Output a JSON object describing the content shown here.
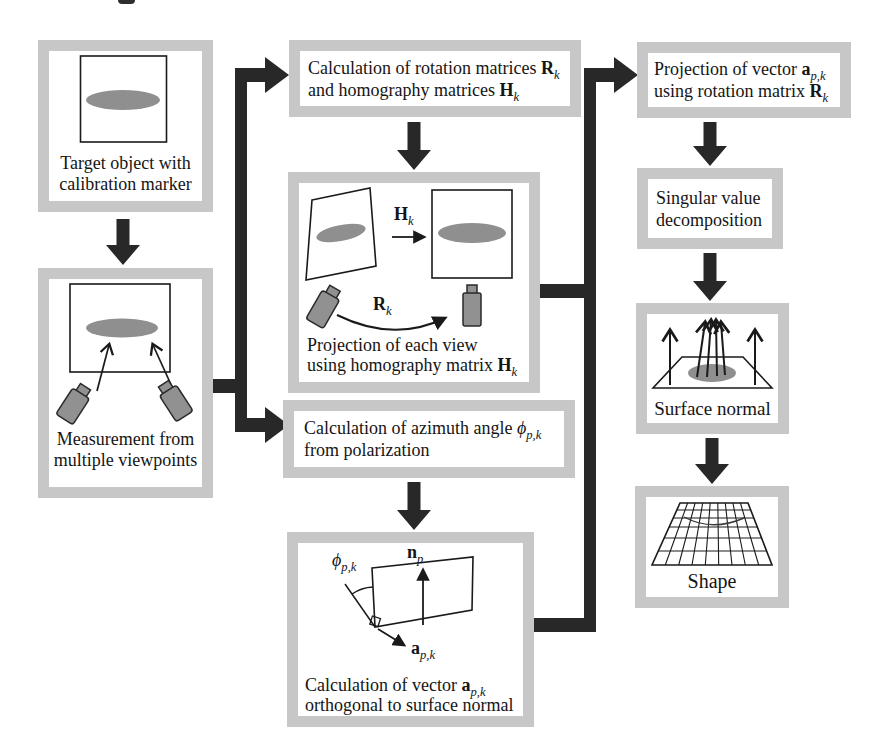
{
  "palette": {
    "frame_gray": "#c7c7c7",
    "flow_arrow_dark": "#282828",
    "marker_gray": "#8f8f8f",
    "camera_gray": "#919191",
    "line_dark": "#1a1a1a"
  },
  "boxes": {
    "target": {
      "line1": "Target object with",
      "line2": "calibration marker"
    },
    "measure": {
      "line1": "Measurement from",
      "line2": "multiple viewpoints"
    },
    "rotation": {
      "line1": [
        {
          "t": "Calculation of rotation matrices "
        },
        {
          "t": "R",
          "b": true
        },
        {
          "t": "k",
          "sub": true,
          "i": true
        }
      ],
      "line2": [
        {
          "t": "and homography matrices "
        },
        {
          "t": "H",
          "b": true
        },
        {
          "t": "k",
          "sub": true,
          "i": true
        }
      ]
    },
    "projection": {
      "label_h": [
        {
          "t": "H",
          "b": true
        },
        {
          "t": "k",
          "sub": true,
          "i": true
        }
      ],
      "label_r": [
        {
          "t": "R",
          "b": true
        },
        {
          "t": "k",
          "sub": true,
          "i": true
        }
      ],
      "line1": [
        {
          "t": "Projection of each view"
        }
      ],
      "line2": [
        {
          "t": "using homography matrix "
        },
        {
          "t": "H",
          "b": true
        },
        {
          "t": "k",
          "sub": true,
          "i": true
        }
      ]
    },
    "azimuth": {
      "line1": [
        {
          "t": "Calculation of azimuth angle "
        },
        {
          "t": "ϕ",
          "i": true
        },
        {
          "t": "p,k",
          "sub": true,
          "i": true
        }
      ],
      "line2": [
        {
          "t": "from polarization"
        }
      ]
    },
    "ortho": {
      "label_phi": [
        {
          "t": "ϕ",
          "i": true
        },
        {
          "t": "p,k",
          "sub": true,
          "i": true
        }
      ],
      "label_n": [
        {
          "t": "n",
          "b": true
        },
        {
          "t": "p",
          "sub": true,
          "i": true
        }
      ],
      "label_a": [
        {
          "t": "a",
          "b": true
        },
        {
          "t": "p,k",
          "sub": true,
          "i": true
        }
      ],
      "line1": [
        {
          "t": "Calculation of vector "
        },
        {
          "t": "a",
          "b": true
        },
        {
          "t": "p,k",
          "sub": true,
          "i": true
        }
      ],
      "line2": [
        {
          "t": "orthogonal to surface normal"
        }
      ]
    },
    "projvec": {
      "line1": [
        {
          "t": "Projection of vector "
        },
        {
          "t": "a",
          "b": true
        },
        {
          "t": "p,k",
          "sub": true,
          "i": true
        }
      ],
      "line2": [
        {
          "t": "using rotation matrix "
        },
        {
          "t": "R",
          "b": true
        },
        {
          "t": "k",
          "sub": true,
          "i": true
        }
      ]
    },
    "svd": {
      "line1": "Singular value",
      "line2": "decomposition"
    },
    "normal": {
      "caption": "Surface normal"
    },
    "shape": {
      "caption": "Shape"
    }
  }
}
